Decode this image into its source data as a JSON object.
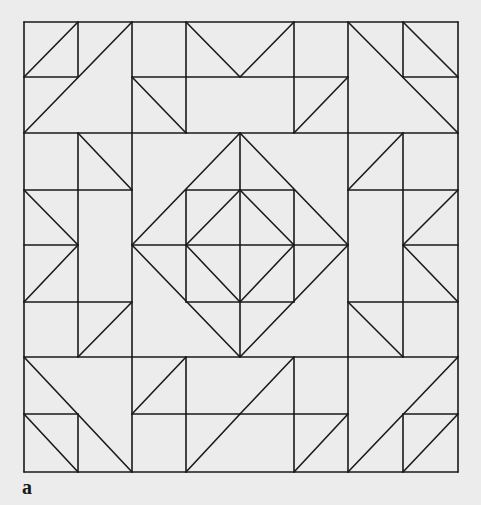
{
  "figure": {
    "label": "a",
    "line_color": "#1a1a1a",
    "background_color": "#ececec",
    "grid": {
      "cols": 8,
      "rows": 8,
      "x": [
        24,
        78,
        132,
        186,
        240,
        294,
        348,
        403,
        458
      ],
      "y": [
        22,
        77,
        133,
        190,
        245,
        302,
        357,
        414,
        472
      ]
    },
    "segments": [
      [
        0,
        0,
        8,
        0
      ],
      [
        0,
        8,
        8,
        8
      ],
      [
        0,
        0,
        0,
        8
      ],
      [
        8,
        0,
        8,
        8
      ],
      [
        0,
        2,
        8,
        2
      ],
      [
        0,
        6,
        8,
        6
      ],
      [
        2,
        0,
        2,
        8
      ],
      [
        6,
        0,
        6,
        8
      ],
      [
        0,
        1,
        1,
        1
      ],
      [
        1,
        0,
        1,
        1
      ],
      [
        0,
        1,
        1,
        0
      ],
      [
        0,
        2,
        2,
        0
      ],
      [
        2,
        1,
        4,
        1
      ],
      [
        3,
        0,
        3,
        2
      ],
      [
        3,
        0,
        4,
        1
      ],
      [
        2,
        1,
        3,
        2
      ],
      [
        4,
        1,
        6,
        1
      ],
      [
        5,
        0,
        5,
        2
      ],
      [
        4,
        1,
        5,
        0
      ],
      [
        5,
        2,
        6,
        1
      ],
      [
        7,
        1,
        8,
        1
      ],
      [
        7,
        0,
        7,
        1
      ],
      [
        7,
        0,
        8,
        1
      ],
      [
        6,
        0,
        8,
        2
      ],
      [
        1,
        2,
        1,
        6
      ],
      [
        1,
        2,
        2,
        3
      ],
      [
        0,
        3,
        2,
        3
      ],
      [
        0,
        3,
        1,
        4
      ],
      [
        1,
        4,
        0,
        5
      ],
      [
        0,
        4,
        1,
        4
      ],
      [
        0,
        5,
        2,
        5
      ],
      [
        1,
        6,
        2,
        5
      ],
      [
        7,
        2,
        7,
        6
      ],
      [
        6,
        3,
        7,
        2
      ],
      [
        6,
        3,
        8,
        3
      ],
      [
        7,
        4,
        8,
        3
      ],
      [
        7,
        4,
        8,
        5
      ],
      [
        7,
        4,
        8,
        4
      ],
      [
        6,
        5,
        8,
        5
      ],
      [
        6,
        5,
        7,
        6
      ],
      [
        2,
        4,
        4,
        2
      ],
      [
        4,
        2,
        6,
        4
      ],
      [
        6,
        4,
        4,
        6
      ],
      [
        4,
        6,
        2,
        4
      ],
      [
        3,
        3,
        5,
        3
      ],
      [
        3,
        5,
        5,
        5
      ],
      [
        3,
        3,
        3,
        5
      ],
      [
        5,
        3,
        5,
        5
      ],
      [
        3,
        4,
        4,
        3
      ],
      [
        4,
        3,
        5,
        4
      ],
      [
        5,
        4,
        4,
        5
      ],
      [
        4,
        5,
        3,
        4
      ],
      [
        4,
        2,
        4,
        6
      ],
      [
        2,
        4,
        6,
        4
      ],
      [
        0,
        6,
        2,
        8
      ],
      [
        0,
        7,
        1,
        7
      ],
      [
        1,
        7,
        1,
        8
      ],
      [
        0,
        7,
        1,
        8
      ],
      [
        2,
        7,
        3,
        6
      ],
      [
        3,
        6,
        3,
        8
      ],
      [
        2,
        7,
        4,
        7
      ],
      [
        3,
        8,
        4,
        7
      ],
      [
        4,
        7,
        5,
        6
      ],
      [
        5,
        6,
        5,
        8
      ],
      [
        4,
        7,
        6,
        7
      ],
      [
        5,
        8,
        6,
        7
      ],
      [
        6,
        8,
        8,
        6
      ],
      [
        7,
        7,
        8,
        7
      ],
      [
        7,
        7,
        7,
        8
      ],
      [
        7,
        8,
        8,
        7
      ]
    ]
  }
}
